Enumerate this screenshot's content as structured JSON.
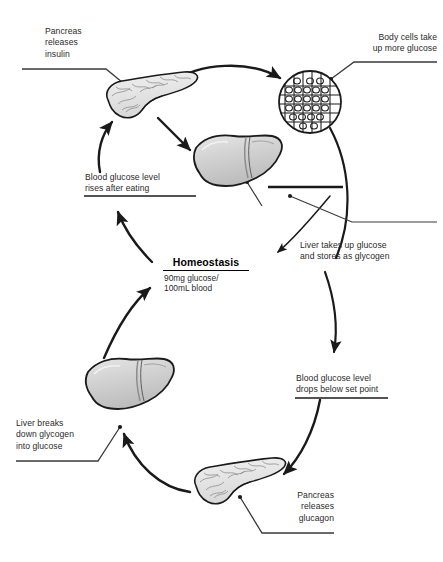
{
  "diagram": {
    "center": {
      "name": "homeostasis-setpoint",
      "title": "Homeostasis",
      "value_line1": "90mg glucose/",
      "value_line2": "100mL blood"
    },
    "labels": [
      {
        "id": "pancreas-insulin",
        "lines": [
          "Pancreas",
          "releases",
          "insulin"
        ],
        "align": "left"
      },
      {
        "id": "body-cells-glucose",
        "lines": [
          "Body cells take",
          "up more glucose"
        ],
        "align": "right"
      },
      {
        "id": "glucose-rises",
        "lines": [
          "Blood glucose level",
          "rises after eating"
        ],
        "align": "left"
      },
      {
        "id": "liver-stores-glycogen",
        "lines": [
          "Liver takes up glucose",
          "and stores as glycogen"
        ],
        "align": "left"
      },
      {
        "id": "glucose-drops",
        "lines": [
          "Blood glucose level",
          "drops below set point"
        ],
        "align": "left"
      },
      {
        "id": "pancreas-glucagon",
        "lines": [
          "Pancreas",
          "releases",
          "glucagon"
        ],
        "align": "right"
      },
      {
        "id": "liver-breaks-glycogen",
        "lines": [
          "Liver breaks",
          "down glycogen",
          "into glucose"
        ],
        "align": "left"
      }
    ],
    "organs": [
      {
        "id": "pancreas-top",
        "name": "pancreas-organ"
      },
      {
        "id": "body-cells",
        "name": "body-cells-circle"
      },
      {
        "id": "liver-top",
        "name": "liver-organ"
      },
      {
        "id": "liver-bottom",
        "name": "liver-organ"
      },
      {
        "id": "pancreas-bottom",
        "name": "pancreas-organ"
      }
    ],
    "colors": {
      "stroke": "#1a1a1a",
      "organ_fill": "#cdcdcd",
      "organ_fill_light": "#e2e2e2",
      "background": "#ffffff",
      "text": "#2b2b2b"
    }
  }
}
